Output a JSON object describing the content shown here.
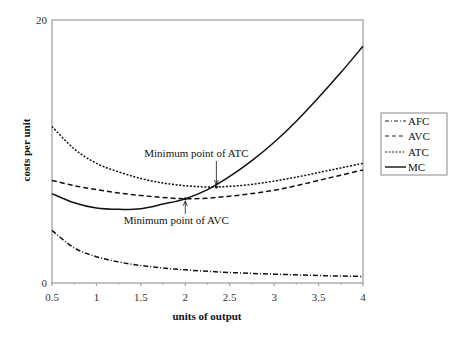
{
  "chart_data": {
    "type": "line",
    "title": "",
    "xlabel": "units of output",
    "ylabel": "costs per unit",
    "xlim": [
      0.5,
      4
    ],
    "ylim": [
      0,
      20
    ],
    "x_ticks": [
      "0.5",
      "1",
      "1.5",
      "2",
      "2.5",
      "3",
      "3.5",
      "4"
    ],
    "y_ticks": [
      "0",
      "20"
    ],
    "grid": false,
    "legend_position": "right",
    "x": [
      0.5,
      0.75,
      1,
      1.25,
      1.5,
      1.75,
      2,
      2.25,
      2.5,
      2.75,
      3,
      3.25,
      3.5,
      3.75,
      4
    ],
    "series": [
      {
        "name": "AFC",
        "style": "dash-dot",
        "values": [
          4.0,
          2.67,
          2.0,
          1.6,
          1.33,
          1.14,
          1.0,
          0.89,
          0.8,
          0.73,
          0.67,
          0.62,
          0.57,
          0.53,
          0.5
        ]
      },
      {
        "name": "AVC",
        "style": "dashed",
        "values": [
          7.8,
          7.4,
          7.1,
          6.85,
          6.65,
          6.5,
          6.4,
          6.45,
          6.6,
          6.8,
          7.05,
          7.4,
          7.8,
          8.2,
          8.6
        ]
      },
      {
        "name": "ATC",
        "style": "dotted",
        "values": [
          11.9,
          10.2,
          9.1,
          8.45,
          7.95,
          7.6,
          7.4,
          7.3,
          7.35,
          7.5,
          7.75,
          8.05,
          8.4,
          8.75,
          9.1
        ]
      },
      {
        "name": "MC",
        "style": "solid",
        "values": [
          6.8,
          6.1,
          5.7,
          5.6,
          5.65,
          6.0,
          6.4,
          7.1,
          8.1,
          9.3,
          10.7,
          12.3,
          14.1,
          16.0,
          18.0
        ]
      }
    ],
    "annotations": [
      {
        "text": "Minimum point of ATC",
        "x": 2.35,
        "y": 7.3
      },
      {
        "text": "Minimum point of AVC",
        "x": 2.0,
        "y": 6.4
      }
    ]
  },
  "legend": {
    "items": [
      {
        "label": "AFC"
      },
      {
        "label": "AVC"
      },
      {
        "label": "ATC"
      },
      {
        "label": "MC"
      }
    ]
  }
}
